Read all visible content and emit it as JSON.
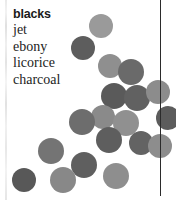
{
  "page": {
    "width": 176,
    "height": 200,
    "background": "#ffffff"
  },
  "word_list": {
    "title": "blacks",
    "items": [
      {
        "label": "jet"
      },
      {
        "label": "ebony"
      },
      {
        "label": "licorice"
      },
      {
        "label": "charcoal"
      }
    ]
  },
  "vertical_rule": {
    "x": 160,
    "y": 0,
    "height": 196,
    "color": "#2b2b2b"
  },
  "scan_strip": {
    "x": 5,
    "color": "#e6e6e6"
  },
  "chart_data": {
    "type": "scatter",
    "title": "blacks",
    "xlabel": "",
    "ylabel": "",
    "xlim": [
      0,
      176
    ],
    "ylim": [
      0,
      200
    ],
    "grid": false,
    "legend": "none",
    "marker": "circle",
    "annotations": [
      "blacks",
      "jet",
      "ebony",
      "licorice",
      "charcoal"
    ],
    "points": [
      {
        "x": 101,
        "y": 26,
        "r": 12,
        "color": "#9a9a9a"
      },
      {
        "x": 83,
        "y": 48,
        "r": 12,
        "color": "#5d5d5d"
      },
      {
        "x": 110,
        "y": 66,
        "r": 12,
        "color": "#8f8f8f"
      },
      {
        "x": 131,
        "y": 72,
        "r": 13,
        "color": "#6a6a6a"
      },
      {
        "x": 114,
        "y": 96,
        "r": 13,
        "color": "#5a5a5a"
      },
      {
        "x": 137,
        "y": 98,
        "r": 13,
        "color": "#616161"
      },
      {
        "x": 158,
        "y": 92,
        "r": 12,
        "color": "#8c8c8c"
      },
      {
        "x": 103,
        "y": 117,
        "r": 12,
        "color": "#8a8a8a"
      },
      {
        "x": 82,
        "y": 122,
        "r": 13,
        "color": "#6d6d6d"
      },
      {
        "x": 126,
        "y": 123,
        "r": 13,
        "color": "#909090"
      },
      {
        "x": 168,
        "y": 118,
        "r": 12,
        "color": "#5c5c5c"
      },
      {
        "x": 109,
        "y": 140,
        "r": 13,
        "color": "#5e5e5e"
      },
      {
        "x": 141,
        "y": 143,
        "r": 12,
        "color": "#636363"
      },
      {
        "x": 160,
        "y": 146,
        "r": 12,
        "color": "#8d8d8d"
      },
      {
        "x": 51,
        "y": 151,
        "r": 13,
        "color": "#747474"
      },
      {
        "x": 84,
        "y": 165,
        "r": 13,
        "color": "#5f5f5f"
      },
      {
        "x": 116,
        "y": 176,
        "r": 13,
        "color": "#8e8e8e"
      },
      {
        "x": 63,
        "y": 180,
        "r": 13,
        "color": "#888888"
      },
      {
        "x": 24,
        "y": 180,
        "r": 12,
        "color": "#585858"
      }
    ]
  }
}
